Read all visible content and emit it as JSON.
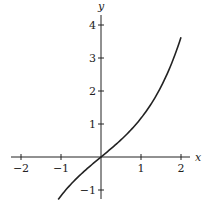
{
  "chart_data": {
    "type": "line",
    "title": "",
    "xlabel": "x",
    "ylabel": "y",
    "xlim": [
      -2.2,
      2.3
    ],
    "ylim": [
      -1.3,
      4.3
    ],
    "x_ticks": [
      -2,
      -1,
      1,
      2
    ],
    "x_tick_labels": [
      "−2",
      "−1",
      "1",
      "2"
    ],
    "y_ticks": [
      -1,
      1,
      2,
      3,
      4
    ],
    "y_tick_labels": [
      "−1",
      "1",
      "2",
      "3",
      "4"
    ],
    "grid": false,
    "series": [
      {
        "name": "curve",
        "description": "approximately y = sinh(x)",
        "x": [
          -1.07,
          -0.8,
          -0.5,
          -0.25,
          0,
          0.25,
          0.5,
          0.75,
          1.0,
          1.25,
          1.5,
          1.75,
          2.0
        ],
        "y": [
          -1.29,
          -0.89,
          -0.52,
          -0.25,
          0,
          0.25,
          0.52,
          0.82,
          1.18,
          1.6,
          2.13,
          2.79,
          3.63
        ]
      }
    ],
    "color": "#222222"
  },
  "colors": {
    "background": "#ffffff",
    "ink": "#222222"
  }
}
